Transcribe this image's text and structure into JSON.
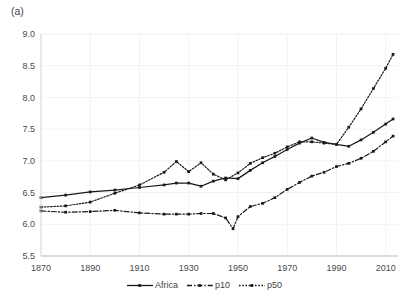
{
  "panel": {
    "label": "(a)"
  },
  "chart_data": {
    "type": "line",
    "title": "",
    "xlabel": "",
    "ylabel": "",
    "xlim": [
      1870,
      2015
    ],
    "ylim": [
      5.5,
      9.0
    ],
    "yticks": [
      "5.5",
      "6.0",
      "6.5",
      "7.0",
      "7.5",
      "8.0",
      "8.5",
      "9.0"
    ],
    "ytick_values": [
      5.5,
      6.0,
      6.5,
      7.0,
      7.5,
      8.0,
      8.5,
      9.0
    ],
    "xticks": [
      "1870",
      "1890",
      "1910",
      "1930",
      "1950",
      "1970",
      "1990",
      "2010"
    ],
    "xtick_values": [
      1870,
      1890,
      1910,
      1930,
      1950,
      1970,
      1990,
      2010
    ],
    "grid": true,
    "grid_color": "#f2f2f2",
    "legend_position": "bottom-center",
    "line_color": "#1a1a1a",
    "series": [
      {
        "name": "Africa",
        "style": "solid",
        "marker": "square",
        "x": [
          1870,
          1880,
          1890,
          1900,
          1910,
          1920,
          1925,
          1930,
          1935,
          1940,
          1945,
          1950,
          1955,
          1960,
          1965,
          1970,
          1975,
          1980,
          1985,
          1990,
          1995,
          2000,
          2005,
          2010,
          2013
        ],
        "y": [
          6.42,
          6.46,
          6.51,
          6.54,
          6.58,
          6.62,
          6.65,
          6.65,
          6.6,
          6.68,
          6.73,
          6.72,
          6.85,
          6.97,
          7.07,
          7.18,
          7.28,
          7.36,
          7.29,
          7.26,
          7.23,
          7.33,
          7.45,
          7.58,
          7.66
        ]
      },
      {
        "name": "p10",
        "style": "dash-dot",
        "marker": "square",
        "x": [
          1870,
          1880,
          1890,
          1900,
          1910,
          1920,
          1925,
          1930,
          1935,
          1940,
          1945,
          1948,
          1950,
          1955,
          1960,
          1965,
          1970,
          1975,
          1980,
          1985,
          1990,
          1995,
          2000,
          2005,
          2010,
          2013
        ],
        "y": [
          6.21,
          6.19,
          6.2,
          6.22,
          6.18,
          6.16,
          6.16,
          6.16,
          6.17,
          6.17,
          6.1,
          5.93,
          6.12,
          6.28,
          6.33,
          6.42,
          6.55,
          6.66,
          6.76,
          6.82,
          6.91,
          6.96,
          7.04,
          7.15,
          7.3,
          7.39
        ]
      },
      {
        "name": "p50",
        "style": "dotted",
        "marker": "square",
        "x": [
          1870,
          1880,
          1890,
          1900,
          1910,
          1920,
          1925,
          1930,
          1935,
          1940,
          1945,
          1950,
          1955,
          1960,
          1965,
          1970,
          1975,
          1980,
          1985,
          1990,
          1995,
          2000,
          2005,
          2010,
          2013
        ],
        "y": [
          6.27,
          6.29,
          6.35,
          6.49,
          6.62,
          6.82,
          6.99,
          6.83,
          6.97,
          6.79,
          6.7,
          6.81,
          6.96,
          7.05,
          7.12,
          7.22,
          7.3,
          7.3,
          7.28,
          7.26,
          7.53,
          7.82,
          8.14,
          8.46,
          8.68
        ]
      }
    ]
  },
  "legend": {
    "items": [
      {
        "label": "Africa",
        "style": "solid"
      },
      {
        "label": "p10",
        "style": "dash-dot"
      },
      {
        "label": "p50",
        "style": "dotted"
      }
    ]
  }
}
